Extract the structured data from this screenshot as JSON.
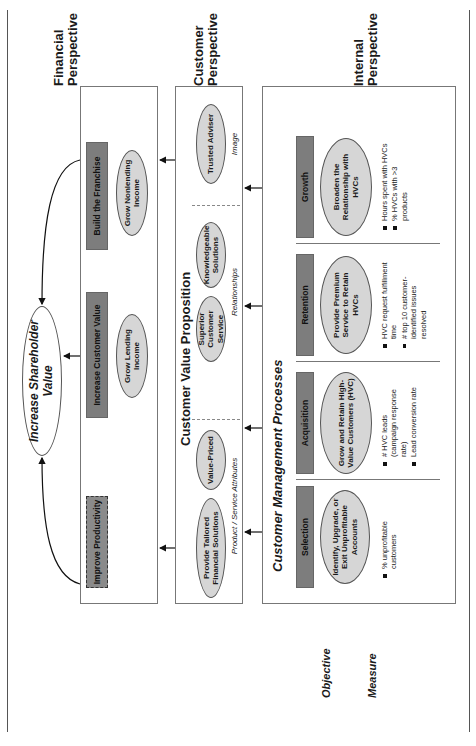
{
  "perspectives": {
    "financial": "Financial Perspective",
    "customer": "Customer Perspective",
    "internal": "Internal Perspective"
  },
  "side_labels": {
    "objective": "Objective",
    "measure": "Measure"
  },
  "financial": {
    "goal": "Increase Shareholder Value",
    "themes": [
      {
        "label": "Improve Productivity",
        "style": "dashed"
      },
      {
        "label": "Increase Customer Value",
        "objective": "Grow Lending Income"
      },
      {
        "label": "Build the Franchise",
        "objective": "Grow Nonlending Income"
      }
    ]
  },
  "customer": {
    "title": "Customer Value Proposition",
    "groups": [
      {
        "label": "Product / Service Attributes",
        "objectives": [
          "Provide Tailored Financial Solutions",
          "Value-Priced"
        ]
      },
      {
        "label": "Relationships",
        "objectives": [
          "Superior Customer Service",
          "Knowledgeable Solutions"
        ]
      },
      {
        "label": "Image",
        "objectives": [
          "Trusted Adviser"
        ]
      }
    ]
  },
  "internal": {
    "title": "Customer Management Processes",
    "processes": [
      {
        "label": "Selection",
        "objective": "Identify, Upgrade, or Exit Unprofitable Accounts",
        "measures": [
          "% unprofitable customers"
        ]
      },
      {
        "label": "Acquisition",
        "objective": "Grow and Retain High-Value Customers (HVC)",
        "measures": [
          "# HVC leads (campaign response rate)",
          "Lead conversion rate"
        ]
      },
      {
        "label": "Retention",
        "objective": "Provide Premium Service to Retain HVCs",
        "measures": [
          "HVC request fulfillment time",
          "# top 10 customer-identified issues resolved"
        ]
      },
      {
        "label": "Growth",
        "objective": "Broaden the Relationship with HVCs",
        "measures": [
          "Hours spent with HVCs",
          "% HVCs with >3 products"
        ]
      }
    ]
  },
  "colors": {
    "theme_bar": "#7d7d7d",
    "objective_fill": "#d6d6d6",
    "border": "#777777"
  }
}
